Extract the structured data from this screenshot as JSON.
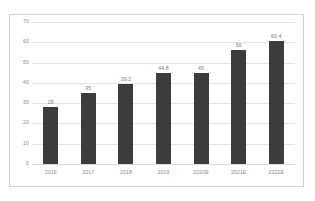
{
  "chart_data": {
    "type": "bar",
    "title": "",
    "subtitle": "",
    "xlabel": "",
    "ylabel": "",
    "categories": [
      "2016",
      "2017",
      "2018",
      "2019",
      "2020E",
      "2021E",
      "2022E"
    ],
    "values": [
      28,
      35,
      39.2,
      44.8,
      45,
      56,
      60.4
    ],
    "value_labels": [
      "28",
      "35",
      "39.2",
      "44.8",
      "45",
      "56",
      "60.4"
    ],
    "ylim": [
      0,
      70
    ],
    "yticks": [
      0,
      10,
      20,
      30,
      40,
      50,
      60,
      70
    ],
    "ytick_labels": [
      "0",
      "10",
      "20",
      "30",
      "40",
      "50",
      "60",
      "70"
    ],
    "grid": true,
    "grid_axis": "y",
    "legend": false,
    "legend_position": "none",
    "series": [
      {
        "name": "",
        "values": [
          28,
          35,
          39.2,
          44.8,
          45,
          56,
          60.4
        ],
        "color": "#3c3c3c"
      }
    ]
  },
  "style": {
    "bar_color": "#3c3c3c",
    "grid_color": "#e4e4e4",
    "border_color": "#d2d2d2",
    "tick_label_color": "#8a8a8a",
    "value_label_color": "#7d7d7d",
    "background": "#ffffff"
  }
}
